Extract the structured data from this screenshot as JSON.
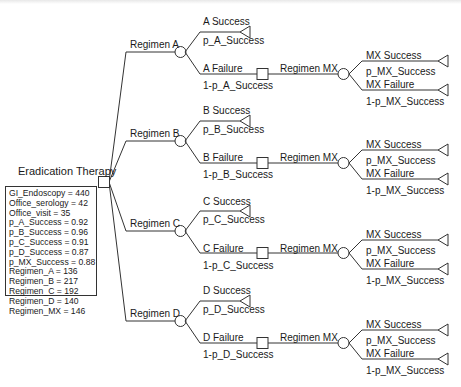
{
  "root": {
    "title": "Eradication Therapy",
    "node_type": "decision",
    "variables": [
      "GI_Endoscopy = 440",
      "Office_serology = 42",
      "Office_visit = 35",
      "p_A_Success = 0.92",
      "p_B_Success = 0.96",
      "p_C_Success = 0.91",
      "p_D_Success = 0.87",
      "p_MX_Success = 0.88",
      "Regimen_A = 136",
      "Regimen_B = 217",
      "Regimen_C = 192",
      "Regimen_D = 140",
      "Regimen_MX = 146"
    ]
  },
  "regimens": [
    {
      "label": "Regimen A",
      "success": {
        "label": "A Success",
        "prob": "p_A_Success"
      },
      "failure": {
        "label": "A Failure",
        "prob": "1-p_A_Success"
      },
      "rescue": {
        "label": "Regimen MX",
        "success": {
          "label": "MX Success",
          "prob": "p_MX_Success"
        },
        "failure": {
          "label": "MX Failure",
          "prob": "1-p_MX_Success"
        }
      }
    },
    {
      "label": "Regimen B",
      "success": {
        "label": "B Success",
        "prob": "p_B_Success"
      },
      "failure": {
        "label": "B Failure",
        "prob": "1-p_B_Success"
      },
      "rescue": {
        "label": "Regimen MX",
        "success": {
          "label": "MX Success",
          "prob": "p_MX_Success"
        },
        "failure": {
          "label": "MX Failure",
          "prob": "1-p_MX_Success"
        }
      }
    },
    {
      "label": "Regimen C",
      "success": {
        "label": "C Success",
        "prob": "p_C_Success"
      },
      "failure": {
        "label": "C Failure",
        "prob": "1-p_C_Success"
      },
      "rescue": {
        "label": "Regimen MX",
        "success": {
          "label": "MX Success",
          "prob": "p_MX_Success"
        },
        "failure": {
          "label": "MX Failure",
          "prob": "1-p_MX_Success"
        }
      }
    },
    {
      "label": "Regimen D",
      "success": {
        "label": "D Success",
        "prob": "p_D_Success"
      },
      "failure": {
        "label": "D Failure",
        "prob": "1-p_D_Success"
      },
      "rescue": {
        "label": "Regimen MX",
        "success": {
          "label": "MX Success",
          "prob": "p_MX_Success"
        },
        "failure": {
          "label": "MX Failure",
          "prob": "1-p_MX_Success"
        }
      }
    }
  ],
  "colors": {
    "line": "#333333",
    "text": "#1a1a1a",
    "background": "#ffffff"
  }
}
